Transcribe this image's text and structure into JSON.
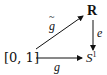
{
  "diagram": {
    "type": "commutative-diagram",
    "nodes": {
      "interval": {
        "label": "[0, 1]"
      },
      "reals": {
        "label": "R"
      },
      "circle": {
        "label": "S",
        "superscript": "1"
      }
    },
    "arrows": {
      "lift": {
        "from": "interval",
        "to": "reals",
        "label": "g",
        "decoration": "tilde"
      },
      "path": {
        "from": "interval",
        "to": "circle",
        "label": "g"
      },
      "covering": {
        "from": "reals",
        "to": "circle",
        "label": "e"
      }
    },
    "colors": {
      "ink": "#111111",
      "background": "#ffffff"
    }
  }
}
